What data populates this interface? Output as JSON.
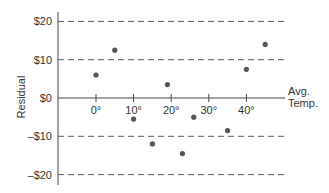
{
  "chart_data": {
    "type": "scatter",
    "title": "",
    "xlabel": "Avg. Temp.",
    "xlabel_lines": [
      "Avg.",
      "Temp."
    ],
    "ylabel": "Residual",
    "x_ticks": [
      0,
      10,
      20,
      30,
      40
    ],
    "x_tick_labels": [
      "0°",
      "10°",
      "20°",
      "30°",
      "40°"
    ],
    "y_ticks": [
      20,
      10,
      0,
      -10,
      -20
    ],
    "y_tick_labels": [
      "$20",
      "$10",
      "$0",
      "–$10",
      "–$20"
    ],
    "xlim": [
      -10,
      50
    ],
    "ylim": [
      -22.5,
      22.5
    ],
    "grid": {
      "horizontal_dashed_at": [
        20,
        10,
        -10,
        -20
      ]
    },
    "legend": null,
    "series": [
      {
        "name": "Residuals",
        "color": "#555555",
        "points": [
          {
            "x": 0,
            "y": 6
          },
          {
            "x": 5,
            "y": 12.5
          },
          {
            "x": 10,
            "y": -5.5
          },
          {
            "x": 15,
            "y": -12
          },
          {
            "x": 19,
            "y": 3.5
          },
          {
            "x": 23,
            "y": -14.5
          },
          {
            "x": 26,
            "y": -5
          },
          {
            "x": 35,
            "y": -8.5
          },
          {
            "x": 40,
            "y": 7.5
          },
          {
            "x": 45,
            "y": 14
          }
        ]
      }
    ]
  },
  "colors": {
    "axis": "#444444",
    "grid": "#555555",
    "point": "#555555",
    "text": "#333333"
  }
}
